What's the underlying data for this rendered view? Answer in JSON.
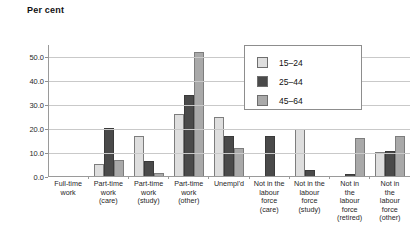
{
  "chart_data": {
    "type": "bar",
    "title": "Per cent",
    "xlabel": "",
    "ylabel": "Per cent",
    "ylim": [
      0,
      55
    ],
    "grid": true,
    "legend_position": "inside-top-right",
    "ytick_labels": [
      "0.0",
      "10.0",
      "20.0",
      "30.0",
      "40.0",
      "50.0"
    ],
    "ytick_values": [
      0,
      10,
      20,
      30,
      40,
      50
    ],
    "categories": [
      "Full-time\nwork",
      "Part-time\nwork\n(care)",
      "Part-time\nwork\n(study)",
      "Part-time\nwork\n(other)",
      "Unempl'd",
      "Not in the\nlabour\nforce\n(care)",
      "Not in the\nlabour\nforce\n(study)",
      "Not in\nthe\nlabour\nforce\n(retired)",
      "Not in\nthe\nlabour\nforce\n(other)"
    ],
    "series": [
      {
        "name": "15–24",
        "color": "#dedede",
        "values": [
          0.0,
          4.8,
          16.8,
          25.8,
          24.5,
          0.0,
          19.5,
          0.0,
          10.0
        ]
      },
      {
        "name": "25–44",
        "color": "#4a4a4a",
        "values": [
          0.0,
          20.0,
          6.3,
          33.6,
          16.5,
          16.7,
          2.5,
          1.0,
          10.5
        ]
      },
      {
        "name": "45–64",
        "color": "#a9a9a9",
        "values": [
          0.0,
          6.5,
          1.3,
          51.5,
          11.5,
          0.0,
          0.0,
          16.0,
          16.5
        ]
      }
    ]
  },
  "legend": {
    "items": [
      {
        "label": "15–24"
      },
      {
        "label": "25–44"
      },
      {
        "label": "45–64"
      }
    ]
  }
}
